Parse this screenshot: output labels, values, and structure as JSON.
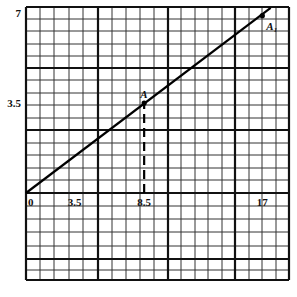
{
  "chart_data": {
    "type": "line",
    "title": "",
    "xlabel": "",
    "ylabel": "",
    "xlim": [
      0,
      19
    ],
    "ylim": [
      -3.4,
      7.2
    ],
    "grid": true,
    "x_ticks": [
      {
        "value": 0,
        "label": "0"
      },
      {
        "value": 3.5,
        "label": "3.5"
      },
      {
        "value": 8.5,
        "label": "8.5"
      },
      {
        "value": 17,
        "label": "17"
      }
    ],
    "y_ticks": [
      {
        "value": 7,
        "label": "7"
      },
      {
        "value": 3.5,
        "label": "3.5"
      }
    ],
    "series": [
      {
        "name": "line",
        "x": [
          0,
          17.6
        ],
        "y": [
          0,
          7.2
        ]
      }
    ],
    "points": [
      {
        "name": "A",
        "label": "A",
        "x": 8.5,
        "y": 3.5
      },
      {
        "name": "A1",
        "label": "A₁",
        "x": 17,
        "y": 6.9
      }
    ],
    "annotations": [
      {
        "type": "dashed-vertical",
        "x": 8.5,
        "from_y": 0,
        "to_y": 3.5
      }
    ]
  }
}
